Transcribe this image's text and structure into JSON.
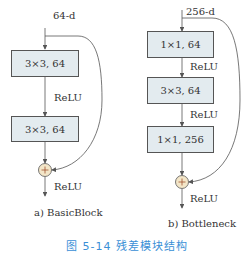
{
  "basic_block": {
    "input_label": "64-d",
    "layers": [
      {
        "label": "3×3, 64"
      },
      {
        "label": "3×3, 64"
      }
    ],
    "activations": [
      "ReLU",
      "ReLU"
    ],
    "adder_symbol": "+",
    "caption": "a) BasicBlock"
  },
  "bottleneck": {
    "input_label": "256-d",
    "layers": [
      {
        "label": "1×1, 64"
      },
      {
        "label": "3×3, 64"
      },
      {
        "label": "1×1, 256"
      }
    ],
    "activations": [
      "ReLU",
      "ReLU",
      "ReLU"
    ],
    "adder_symbol": "+",
    "caption": "b) Bottleneck"
  },
  "figure_caption": "图 5-14 残差模块结构",
  "colors": {
    "box_fill": "#e3ebef",
    "adder_fill": "#f3e6c8",
    "caption_blue": "#3a8fd6",
    "line": "#555555"
  }
}
